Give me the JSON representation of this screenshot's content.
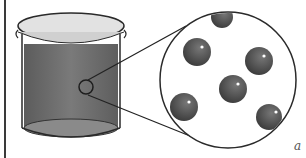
{
  "diagram": {
    "label": "a",
    "colors": {
      "liquid": "#6e6e6e",
      "glass": "#dcdcdc",
      "outline": "#2a2a2a",
      "particle": "#4a4a4a",
      "highlight": "#ffffff"
    },
    "parts": [
      "beaker",
      "liquid",
      "magnifier-circle",
      "zoom-lines",
      "particles"
    ],
    "particle_count": 6
  }
}
